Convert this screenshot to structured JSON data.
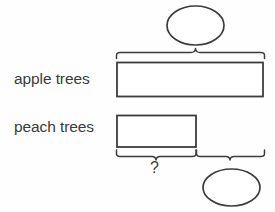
{
  "diagram": {
    "type": "tape-diagram",
    "title": "",
    "stroke_color": "#3d3d3d",
    "fill_color": "#ffffff",
    "background_color": "#fefefe",
    "rows": [
      {
        "label": "apple trees",
        "bar_name": "apple-trees-bar",
        "value": "",
        "relative_length": 1.0
      },
      {
        "label": "peach trees",
        "bar_name": "peach-trees-bar",
        "value": "",
        "relative_length": 0.545
      }
    ],
    "annotations": {
      "top_brace_label": "",
      "top_oval_value": "",
      "bottom_left_brace_label": "?",
      "bottom_right_brace_label": "",
      "bottom_right_oval_value": ""
    }
  }
}
